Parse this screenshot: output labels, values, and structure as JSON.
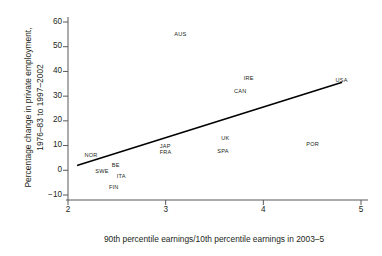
{
  "chart_data": {
    "type": "scatter",
    "title": "",
    "xlabel": "90th percentile earnings/10th percentile earnings in 2003–5",
    "ylabel": "Percentage change in private employment, 1976–83 to 1997–2002",
    "ylabel_line1": "Percentage change in private employment,",
    "ylabel_line2": "1976–83 to 1997–2002",
    "xlim": [
      2,
      5
    ],
    "ylim": [
      -10,
      60
    ],
    "xticks": [
      "2",
      "3",
      "4",
      "5"
    ],
    "xtick_values": [
      2,
      3,
      4,
      5
    ],
    "yticks": [
      "60",
      "50",
      "40",
      "30",
      "20",
      "10",
      "0",
      "−10"
    ],
    "ytick_values": [
      60,
      50,
      40,
      30,
      20,
      10,
      0,
      -10
    ],
    "grid": false,
    "legend": "none",
    "point_marker": "country-code-text-label",
    "points": [
      {
        "label": "AUS",
        "x": 3.15,
        "y": 55.0
      },
      {
        "label": "IRE",
        "x": 3.86,
        "y": 37.0
      },
      {
        "label": "CAN",
        "x": 3.76,
        "y": 32.0
      },
      {
        "label": "USA",
        "x": 4.8,
        "y": 36.5
      },
      {
        "label": "UK",
        "x": 3.63,
        "y": 13.0
      },
      {
        "label": "POR",
        "x": 4.5,
        "y": 10.5
      },
      {
        "label": "JAP",
        "x": 3.0,
        "y": 9.5
      },
      {
        "label": "SPA",
        "x": 3.59,
        "y": 7.5
      },
      {
        "label": "FRA",
        "x": 3.0,
        "y": 7.0
      },
      {
        "label": "NOR",
        "x": 2.23,
        "y": 6.0
      },
      {
        "label": "BE",
        "x": 2.51,
        "y": 2.0
      },
      {
        "label": "SWE",
        "x": 2.34,
        "y": -0.5
      },
      {
        "label": "ITA",
        "x": 2.56,
        "y": -2.5
      },
      {
        "label": "FIN",
        "x": 2.48,
        "y": -7.0
      }
    ],
    "trendline": {
      "name": "regression-line",
      "x_start": 2.1,
      "y_start": 2.0,
      "x_end": 4.8,
      "y_end": 35.5
    },
    "colors": {
      "axis": "#58595b",
      "text": "#231f20",
      "trendline": "#000000",
      "background": "#ffffff"
    }
  }
}
